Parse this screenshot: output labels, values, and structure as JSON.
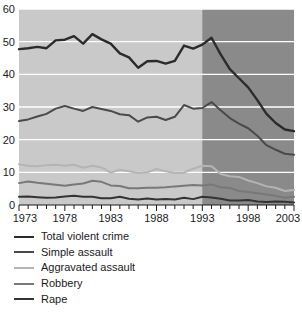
{
  "chart_data": {
    "type": "line",
    "title": "",
    "xlabel": "",
    "ylabel": "",
    "xlim": [
      1973,
      2003
    ],
    "ylim": [
      0,
      60
    ],
    "yticks": [
      0,
      10,
      20,
      30,
      40,
      50,
      60
    ],
    "xticks": [
      1973,
      1978,
      1983,
      1988,
      1993,
      1998,
      2003
    ],
    "xtick_minor_step": 1,
    "grid": "horizontal",
    "legend_position": "below",
    "plot_background": "#c9c9c9",
    "shaded_region": {
      "from": 1993,
      "to": 2003,
      "color": "#8a8a8a",
      "label": ""
    },
    "x": [
      1973,
      1974,
      1975,
      1976,
      1977,
      1978,
      1979,
      1980,
      1981,
      1982,
      1983,
      1984,
      1985,
      1986,
      1987,
      1988,
      1989,
      1990,
      1991,
      1992,
      1993,
      1994,
      1995,
      1996,
      1997,
      1998,
      1999,
      2000,
      2001,
      2002,
      2003
    ],
    "series": [
      {
        "name": "Total violent crime",
        "color": "#2b2b2b",
        "width": 2.4,
        "values": [
          47.7,
          48.0,
          48.4,
          48.0,
          50.4,
          50.6,
          51.7,
          49.4,
          52.3,
          50.7,
          49.4,
          46.4,
          45.2,
          42.0,
          44.0,
          44.1,
          43.3,
          44.1,
          48.8,
          47.9,
          49.1,
          51.2,
          46.1,
          41.6,
          38.8,
          36.0,
          32.1,
          27.9,
          25.1,
          23.1,
          22.6
        ]
      },
      {
        "name": "Simple assault",
        "color": "#4a4a4a",
        "width": 2.0,
        "values": [
          25.7,
          26.2,
          27.1,
          27.9,
          29.5,
          30.3,
          29.5,
          28.8,
          30.0,
          29.4,
          28.8,
          27.8,
          27.5,
          25.5,
          26.8,
          27.0,
          26.0,
          27.0,
          30.6,
          29.5,
          29.7,
          31.5,
          29.0,
          26.6,
          24.9,
          23.5,
          21.2,
          18.3,
          16.9,
          15.7,
          15.4
        ]
      },
      {
        "name": "Aggravated assault",
        "color": "#b4b4b4",
        "width": 2.0,
        "values": [
          12.5,
          12.0,
          11.9,
          12.2,
          12.3,
          12.0,
          12.3,
          11.4,
          12.0,
          11.5,
          9.9,
          10.8,
          10.3,
          9.8,
          10.0,
          11.0,
          10.3,
          9.8,
          9.9,
          11.1,
          12.0,
          11.9,
          9.5,
          8.8,
          8.6,
          7.5,
          6.7,
          5.7,
          5.3,
          4.3,
          4.6
        ]
      },
      {
        "name": "Robbery",
        "color": "#787878",
        "width": 2.0,
        "values": [
          6.7,
          7.2,
          6.8,
          6.5,
          6.2,
          5.9,
          6.3,
          6.6,
          7.4,
          7.1,
          6.0,
          5.8,
          5.1,
          5.1,
          5.3,
          5.3,
          5.4,
          5.7,
          5.9,
          6.1,
          6.0,
          6.3,
          5.4,
          5.2,
          4.3,
          4.0,
          3.6,
          3.2,
          2.8,
          2.2,
          2.5
        ]
      },
      {
        "name": "Rape",
        "color": "#333333",
        "width": 2.0,
        "values": [
          2.5,
          2.6,
          2.4,
          2.2,
          2.3,
          2.6,
          2.8,
          2.5,
          2.5,
          2.1,
          2.1,
          2.5,
          1.9,
          1.7,
          2.0,
          1.7,
          1.8,
          1.7,
          2.2,
          1.8,
          2.5,
          2.3,
          1.9,
          1.4,
          1.4,
          1.5,
          1.1,
          0.9,
          1.1,
          1.0,
          0.8
        ]
      }
    ]
  },
  "legend": {
    "items": [
      {
        "label": "Total violent crime"
      },
      {
        "label": "Simple assault"
      },
      {
        "label": "Aggravated assault"
      },
      {
        "label": "Robbery"
      },
      {
        "label": "Rape"
      }
    ]
  }
}
